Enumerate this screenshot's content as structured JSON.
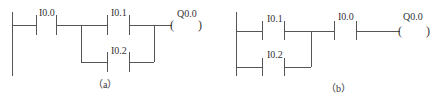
{
  "diagrams": [
    {
      "caption": "（a）",
      "contacts": [
        {
          "name": "I0.0"
        },
        {
          "name": "I0.1"
        },
        {
          "name": "I0.2"
        }
      ],
      "coil": {
        "name": "Q0.0",
        "open": "(",
        "close": ")"
      }
    },
    {
      "caption": "（b）",
      "contacts": [
        {
          "name": "I0.1"
        },
        {
          "name": "I0.2"
        },
        {
          "name": "I0.0"
        }
      ],
      "coil": {
        "name": "Q0.0",
        "open": "(",
        "close": ")"
      }
    }
  ]
}
